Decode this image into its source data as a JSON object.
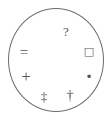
{
  "figure": {
    "outline_color": "#6e6e6e",
    "glyph_color": "#57575a",
    "background_color": "#ffffff"
  },
  "circle": {
    "center_x": 56,
    "center_y": 60,
    "radius_x": 48,
    "radius_y": 52,
    "stroke_width": 1
  },
  "symbols": [
    {
      "id": "question-mark",
      "char": "?",
      "name": "question-mark",
      "x": 66,
      "y": 31
    },
    {
      "id": "equals-sign",
      "char": "=",
      "name": "equals-sign",
      "x": 24,
      "y": 52
    },
    {
      "id": "hollow-square",
      "char": "□",
      "name": "hollow-square",
      "x": 89,
      "y": 51
    },
    {
      "id": "plus-sign",
      "char": "+",
      "name": "plus-sign",
      "x": 26,
      "y": 77
    },
    {
      "id": "bullet-dot",
      "char": "•",
      "name": "bullet-dot",
      "x": 89,
      "y": 77
    },
    {
      "id": "double-dagger",
      "char": "‡",
      "name": "double-dagger",
      "x": 44,
      "y": 96
    },
    {
      "id": "dagger",
      "char": "†",
      "name": "dagger",
      "x": 70,
      "y": 96
    },
    {
      "id": "faint-speck",
      "char": "·",
      "name": "faint-speck",
      "x": 53,
      "y": 118
    }
  ]
}
